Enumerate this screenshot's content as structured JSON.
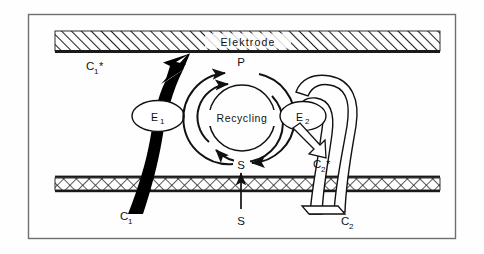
{
  "figure": {
    "type": "scientific-schematic",
    "frame": {
      "border_color": "#6b6b6b",
      "background": "#fefefe"
    },
    "bands": [
      {
        "id": "electrode",
        "label": "Elektrode",
        "pattern": "diagonal-hatch",
        "position": "top",
        "fill": "#ffffff",
        "line_color": "#1a1a1a"
      },
      {
        "id": "membrane",
        "label": "",
        "pattern": "cross-hatch",
        "position": "bottom",
        "fill": "#ffffff",
        "line_color": "#1a1a1a"
      }
    ],
    "cycle": {
      "center_label": "Recycling",
      "top_label": "P",
      "bottom_label": "S",
      "direction": "clockwise-outer-counterclockwise-inner",
      "stroke": "#111111"
    },
    "enzymes": [
      {
        "id": "e1",
        "label": "E",
        "sub": "1",
        "shape": "ellipse",
        "fill": "#ffffff",
        "stroke": "#111111"
      },
      {
        "id": "e2",
        "label": "E",
        "sub": "2",
        "shape": "ellipse",
        "fill": "#ffffff",
        "stroke": "#111111"
      }
    ],
    "species": [
      {
        "id": "c1-star",
        "label": "C",
        "sub": "1",
        "star": "*",
        "location": "above-e1-at-electrode"
      },
      {
        "id": "c1",
        "label": "C",
        "sub": "1",
        "star": "",
        "location": "below-membrane-left"
      },
      {
        "id": "c2-star",
        "label": "C",
        "sub": "2",
        "star": "*",
        "location": "below-e2"
      },
      {
        "id": "c2",
        "label": "C",
        "sub": "2",
        "star": "",
        "location": "below-membrane-right"
      },
      {
        "id": "s-in",
        "label": "S",
        "sub": "",
        "star": "",
        "location": "below-membrane-center"
      },
      {
        "id": "s-cycle",
        "label": "S",
        "sub": "",
        "star": "",
        "location": "cycle-bottom"
      },
      {
        "id": "p-cycle",
        "label": "P",
        "sub": "",
        "star": "",
        "location": "cycle-top"
      }
    ],
    "arrows": [
      {
        "id": "c1-mediator-ribbon",
        "style": "thick-solid-black",
        "from": "c1",
        "to": "c1-star",
        "through": "e1"
      },
      {
        "id": "c2-mediator-ribbon",
        "style": "hollow-outline-white",
        "from": "c2",
        "to": "e2"
      },
      {
        "id": "e2-to-c2-star",
        "style": "hollow-outline-arrow",
        "from": "e2",
        "to": "c2-star"
      },
      {
        "id": "substrate-inflow",
        "style": "thin-line-arrow",
        "from": "s-in",
        "to": "s-cycle"
      }
    ]
  }
}
